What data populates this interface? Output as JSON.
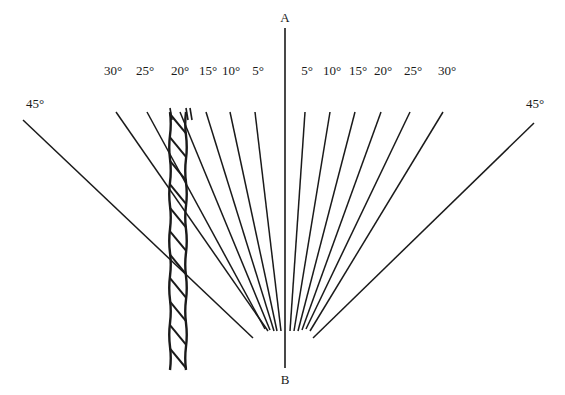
{
  "diagram": {
    "title": "",
    "axis": {
      "top_label": "A",
      "bottom_label": "B",
      "x": 285,
      "y_top": 28,
      "y_bottom": 368
    },
    "left_lines": [
      {
        "label": "30°",
        "angle": 30,
        "label_x": 113,
        "x1": 116,
        "y1": 112,
        "x2": 268,
        "y2": 331
      },
      {
        "label": "25°",
        "angle": 25,
        "label_x": 145,
        "x1": 147,
        "y1": 112,
        "x2": 265,
        "y2": 329
      },
      {
        "label": "20°",
        "angle": 20,
        "label_x": 180,
        "x1": 180,
        "y1": 112,
        "x2": 270,
        "y2": 330
      },
      {
        "label": "15°",
        "angle": 15,
        "label_x": 208,
        "x1": 206,
        "y1": 112,
        "x2": 274,
        "y2": 331
      },
      {
        "label": "10°",
        "angle": 10,
        "label_x": 231,
        "x1": 230,
        "y1": 112,
        "x2": 277,
        "y2": 331
      },
      {
        "label": "5°",
        "angle": 5,
        "label_x": 258,
        "x1": 255,
        "y1": 112,
        "x2": 281,
        "y2": 331
      }
    ],
    "right_lines": [
      {
        "label": "5°",
        "angle": 5,
        "label_x": 307,
        "x1": 305,
        "y1": 112,
        "x2": 290,
        "y2": 331
      },
      {
        "label": "10°",
        "angle": 10,
        "label_x": 332,
        "x1": 330,
        "y1": 112,
        "x2": 294,
        "y2": 331
      },
      {
        "label": "15°",
        "angle": 15,
        "label_x": 358,
        "x1": 355,
        "y1": 112,
        "x2": 298,
        "y2": 331
      },
      {
        "label": "20°",
        "angle": 20,
        "label_x": 383,
        "x1": 381,
        "y1": 112,
        "x2": 302,
        "y2": 330
      },
      {
        "label": "25°",
        "angle": 25,
        "label_x": 413,
        "x1": 410,
        "y1": 112,
        "x2": 306,
        "y2": 329
      },
      {
        "label": "30°",
        "angle": 30,
        "label_x": 447,
        "x1": 443,
        "y1": 112,
        "x2": 310,
        "y2": 331
      }
    ],
    "outer_lines": [
      {
        "label": "45°",
        "angle": 45,
        "side": "left",
        "label_x": 35,
        "label_y": 108,
        "x1": 23,
        "y1": 120,
        "x2": 253,
        "y2": 338
      },
      {
        "label": "45°",
        "angle": 45,
        "side": "right",
        "label_x": 535,
        "label_y": 108,
        "x1": 534,
        "y1": 123,
        "x2": 313,
        "y2": 338
      }
    ],
    "label_row_y": 75,
    "yarn": {
      "description": "twisted yarn strand (Z/S twist illustration)",
      "x_left": 170,
      "x_right": 186,
      "y_top": 112,
      "y_bottom": 370,
      "twist_count": 11
    },
    "colors": {
      "line": "#1a1a1a",
      "background": "#ffffff"
    }
  }
}
